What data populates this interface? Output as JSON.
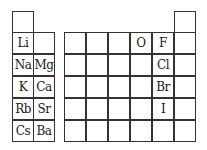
{
  "diagram": {
    "type": "periodic-table-fragment",
    "left_block": {
      "h_cell": {
        "symbol": ""
      },
      "rows": [
        [
          "Li",
          ""
        ],
        [
          "Na",
          "Mg"
        ],
        [
          "K",
          "Ca"
        ],
        [
          "Rb",
          "Sr"
        ],
        [
          "Cs",
          "Ba"
        ]
      ]
    },
    "right_block": {
      "he_cell": {
        "symbol": ""
      },
      "rows": [
        [
          "",
          "",
          "",
          "O",
          "F",
          ""
        ],
        [
          "",
          "",
          "",
          "",
          "Cl",
          ""
        ],
        [
          "",
          "",
          "",
          "",
          "Br",
          ""
        ],
        [
          "",
          "",
          "",
          "",
          "I",
          ""
        ],
        [
          "",
          "",
          "",
          "",
          "",
          ""
        ]
      ]
    }
  }
}
